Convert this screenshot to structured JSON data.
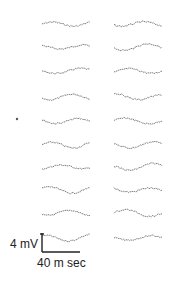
{
  "figure": {
    "columns": 2,
    "rows_per_column": 10,
    "trace_color": "#444444",
    "scale_bar": {
      "voltage_label": "4 mV",
      "time_label": "40 m sec"
    },
    "marker": {
      "row": 5,
      "column": "left",
      "glyph": "•"
    }
  }
}
